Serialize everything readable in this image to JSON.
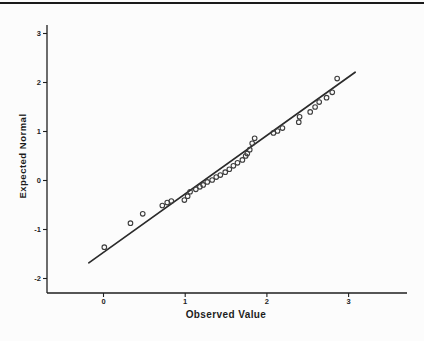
{
  "page": {
    "background": "#fcfcfc",
    "top_rule_color": "#1a1a1a"
  },
  "chart_data": {
    "type": "scatter",
    "xlabel": "Observed Value",
    "ylabel": "Expected Normal",
    "x_ticks": [
      0,
      1,
      2,
      3
    ],
    "y_ticks": [
      3,
      2,
      1,
      0,
      -1,
      -2
    ],
    "xlim": [
      -0.69,
      3.72
    ],
    "ylim": [
      -2.3,
      3.18
    ],
    "grid": false,
    "legend": "none",
    "marker": "open-circle",
    "marker_color": "#3d3d3d",
    "line_color": "#2b2b2b",
    "axis_color": "#1f1f1f",
    "tick_label_color": "#1f1f1f",
    "points": [
      [
        0.01,
        -1.36
      ],
      [
        0.33,
        -0.87
      ],
      [
        0.48,
        -0.68
      ],
      [
        0.72,
        -0.51
      ],
      [
        0.78,
        -0.45
      ],
      [
        0.83,
        -0.42
      ],
      [
        0.99,
        -0.4
      ],
      [
        1.03,
        -0.32
      ],
      [
        1.06,
        -0.23
      ],
      [
        1.13,
        -0.18
      ],
      [
        1.18,
        -0.13
      ],
      [
        1.22,
        -0.09
      ],
      [
        1.27,
        -0.03
      ],
      [
        1.33,
        0.01
      ],
      [
        1.38,
        0.07
      ],
      [
        1.43,
        0.11
      ],
      [
        1.49,
        0.17
      ],
      [
        1.54,
        0.23
      ],
      [
        1.59,
        0.3
      ],
      [
        1.64,
        0.36
      ],
      [
        1.7,
        0.42
      ],
      [
        1.74,
        0.5
      ],
      [
        1.76,
        0.55
      ],
      [
        1.79,
        0.63
      ],
      [
        1.82,
        0.76
      ],
      [
        1.85,
        0.86
      ],
      [
        2.08,
        0.97
      ],
      [
        2.13,
        1.01
      ],
      [
        2.19,
        1.07
      ],
      [
        2.39,
        1.19
      ],
      [
        2.4,
        1.3
      ],
      [
        2.53,
        1.4
      ],
      [
        2.59,
        1.5
      ],
      [
        2.64,
        1.6
      ],
      [
        2.73,
        1.69
      ],
      [
        2.8,
        1.8
      ],
      [
        2.86,
        2.08
      ]
    ],
    "fit_line": {
      "x1": -0.18,
      "y1": -1.68,
      "x2": 3.08,
      "y2": 2.21
    }
  }
}
